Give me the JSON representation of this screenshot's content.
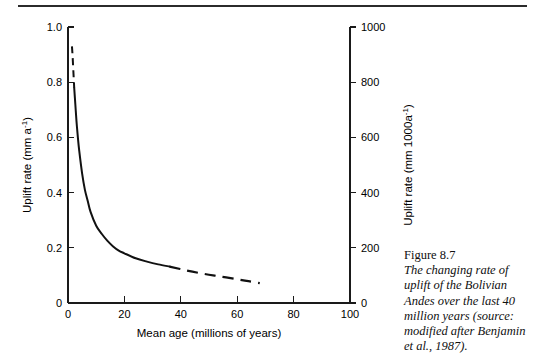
{
  "page": {
    "divider_name": "horizontal-rule"
  },
  "caption": {
    "title": "Figure 8.7",
    "body": "The changing rate of uplift of the Bolivian Andes over the last 40 million years (source: modified after Benjamin et al., 1987)."
  },
  "chart_data": {
    "type": "line",
    "title": "",
    "xlabel": "Mean age (millions of years)",
    "ylabel": "Uplift rate (mm a",
    "ylabel_sup": "-1",
    "ylabel_close": ")",
    "y2label": "Uplift rate (mm 1000a",
    "y2label_sup": "-1",
    "y2label_close": ")",
    "xlim": [
      0,
      100
    ],
    "ylim": [
      0,
      1.0
    ],
    "y2lim": [
      0,
      1000
    ],
    "xticks": [
      0,
      20,
      40,
      60,
      80,
      100
    ],
    "xticklabels": [
      "0",
      "20",
      "40",
      "60",
      "80",
      "100"
    ],
    "yticks": [
      0,
      0.2,
      0.4,
      0.6,
      0.8,
      1.0
    ],
    "yticklabels": [
      "0",
      "0.2",
      "0.4",
      "0.6",
      "0.8",
      "1.0"
    ],
    "y2ticks": [
      0,
      200,
      400,
      600,
      800,
      1000
    ],
    "y2ticklabels": [
      "0",
      "200",
      "400",
      "600",
      "800",
      "1000"
    ],
    "grid": false,
    "legend": false,
    "series": [
      {
        "name": "Uplift rate (extrapolated, young end)",
        "style": "dashed",
        "x": [
          1.4,
          1.6,
          1.8,
          2.0,
          2.2
        ],
        "y": [
          0.93,
          0.9,
          0.86,
          0.82,
          0.78
        ]
      },
      {
        "name": "Uplift rate (measured)",
        "style": "solid",
        "x": [
          2.2,
          2.6,
          3.0,
          3.5,
          4.0,
          5.0,
          6.0,
          7.0,
          8.0,
          10.0,
          12.0,
          14.0,
          16.0,
          18.0,
          20.0,
          24.0,
          28.0,
          32.0,
          36.0
        ],
        "y": [
          0.78,
          0.72,
          0.66,
          0.6,
          0.55,
          0.47,
          0.41,
          0.37,
          0.33,
          0.28,
          0.25,
          0.225,
          0.205,
          0.19,
          0.18,
          0.162,
          0.15,
          0.14,
          0.132
        ]
      },
      {
        "name": "Uplift rate (extrapolated, old end)",
        "style": "dashed",
        "x": [
          36.0,
          42.0,
          48.0,
          54.0,
          60.0,
          64.0,
          68.0
        ],
        "y": [
          0.132,
          0.118,
          0.106,
          0.096,
          0.086,
          0.079,
          0.072
        ]
      }
    ]
  }
}
